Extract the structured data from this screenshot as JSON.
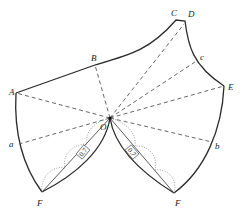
{
  "diagram": {
    "type": "pattern-draft",
    "points": {
      "A": "A",
      "B": "B",
      "C": "C",
      "D": "D",
      "E": "E",
      "a": "a",
      "b": "b",
      "c": "c",
      "O": "O",
      "F_left": "F",
      "F_right": "F"
    },
    "measurements": {
      "left_dart": "0.7",
      "right_dart": "0.7"
    }
  }
}
